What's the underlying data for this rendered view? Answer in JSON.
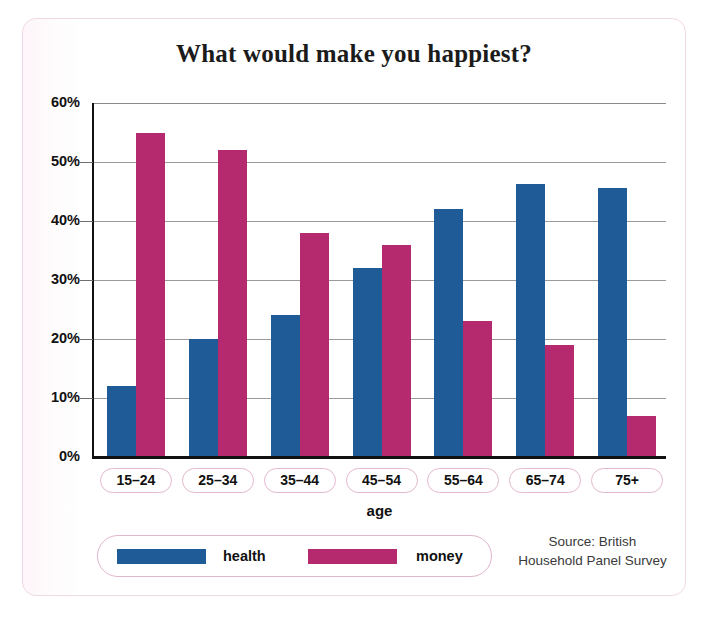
{
  "chart_data": {
    "type": "bar",
    "title": "What would make you happiest?",
    "xlabel": "age",
    "ylabel": "",
    "categories": [
      "15–24",
      "25–34",
      "35–44",
      "45–54",
      "55–64",
      "65–74",
      "75+"
    ],
    "series": [
      {
        "name": "health",
        "color": "#1f5b96",
        "values": [
          12,
          20,
          24,
          32,
          42,
          46.3,
          45.6
        ]
      },
      {
        "name": "money",
        "color": "#b52a6e",
        "values": [
          55,
          52,
          38,
          36,
          23,
          19,
          7
        ]
      }
    ],
    "ylim": [
      0,
      60
    ],
    "yticks": [
      0,
      10,
      20,
      30,
      40,
      50,
      60
    ],
    "ytick_labels": [
      "0%",
      "10%",
      "20%",
      "30%",
      "40%",
      "50%",
      "60%"
    ],
    "grid": true,
    "legend_position": "bottom-left",
    "units": "percent"
  },
  "legend": {
    "entries": [
      {
        "label": "health",
        "color": "#1f5b96"
      },
      {
        "label": "money",
        "color": "#b52a6e"
      }
    ]
  },
  "source": {
    "line1": "Source: British",
    "line2": "Household Panel Survey"
  },
  "colors": {
    "health": "#1f5b96",
    "money": "#b52a6e",
    "frame": "#f0d9e6",
    "pill_border": "#e3b9cf",
    "grid": "#9a9a9a",
    "axis": "#111111"
  }
}
